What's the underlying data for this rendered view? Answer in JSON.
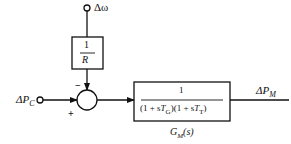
{
  "diagram": {
    "type": "block-diagram",
    "inputs": {
      "speed_deviation": {
        "symbol": "Δω"
      },
      "reference_power": {
        "symbol": "ΔP",
        "subscript": "C"
      }
    },
    "feedback_block": {
      "numerator": "1",
      "denominator": "R"
    },
    "summing_junction": {
      "minus_sign": "−",
      "plus_sign": "+"
    },
    "forward_block": {
      "numerator": "1",
      "denominator": "(1 + sT_G)(1 + sT_T)",
      "denominator_parts": [
        "(1 + s",
        "T",
        "G",
        ")(1 + s",
        "T",
        "T",
        ")"
      ],
      "label": "G_M(s)",
      "label_parts": [
        "G",
        "M",
        "(s)"
      ]
    },
    "output": {
      "symbol": "ΔP",
      "subscript": "M"
    }
  }
}
